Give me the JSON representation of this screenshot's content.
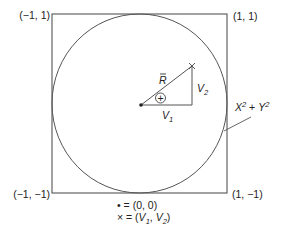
{
  "diagram": {
    "type": "unit-circle-in-square",
    "colors": {
      "stroke": "#555555",
      "text": "#222222",
      "background": "#ffffff"
    },
    "corners": {
      "top_left": "(−1, 1)",
      "top_right": "(1, 1)",
      "bottom_left": "(−1, −1)",
      "bottom_right": "(1, −1)"
    },
    "circle_label": {
      "base_x": "X",
      "sup_x": "2",
      "plus": " + ",
      "base_y": "Y",
      "sup_y": "2"
    },
    "vector": {
      "magnitude_label": "R̄",
      "magnitude_letter": "R",
      "horizontal_component": {
        "base": "V",
        "sub": "1"
      },
      "vertical_component": {
        "base": "V",
        "sub": "2"
      },
      "angle_symbol": "+"
    },
    "legend": {
      "dot_symbol": "•",
      "dot_meaning": " = (0, 0)",
      "cross_symbol": "×",
      "cross_prefix": " = (",
      "cross_v1_base": "V",
      "cross_v1_sub": "1",
      "cross_sep": ", ",
      "cross_v2_base": "V",
      "cross_v2_sub": "2",
      "cross_suffix": ")"
    }
  }
}
